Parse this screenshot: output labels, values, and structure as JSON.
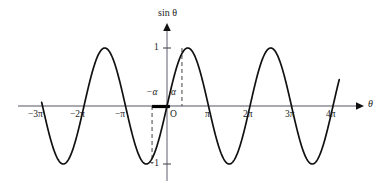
{
  "figure": {
    "kind": "sine-curve-graph",
    "background": "#ffffff",
    "curve_color": "#111111",
    "axis_color": "#8c8c99",
    "dash_color": "#555555",
    "highlight_color": "#000000"
  },
  "axes": {
    "y_axis_title": "sin θ",
    "x_axis_title": "θ",
    "origin_label": "O",
    "x_ticks": [
      {
        "label": "−3π",
        "value": -3
      },
      {
        "label": "−2π",
        "value": -2
      },
      {
        "label": "−π",
        "value": -1
      },
      {
        "label": "π",
        "value": 1
      },
      {
        "label": "2π",
        "value": 2
      },
      {
        "label": "3π",
        "value": 3
      },
      {
        "label": "4π",
        "value": 4
      }
    ],
    "y_ticks": [
      {
        "label": "1",
        "value": 1
      },
      {
        "label": "−1",
        "value": -1
      }
    ],
    "alpha_labels": [
      {
        "label": "−α",
        "value": -0.36
      },
      {
        "label": "α",
        "value": 0.36
      }
    ]
  },
  "chart_data": {
    "type": "line",
    "title": "",
    "subtitle": "",
    "xlabel": "θ",
    "ylabel": "sin θ",
    "function": "y = sin(theta)",
    "xlim": [
      -3.18,
      4.2
    ],
    "ylim": [
      -1.35,
      1.35
    ],
    "x_unit": "pi",
    "grid": false,
    "legend": null,
    "x_tick_values": [
      -3,
      -2,
      -1,
      1,
      2,
      3,
      4
    ],
    "x_tick_labels": [
      "−3π",
      "−2π",
      "−π",
      "π",
      "2π",
      "3π",
      "4π"
    ],
    "y_tick_values": [
      1,
      -1
    ],
    "y_tick_labels": [
      "1",
      "−1"
    ],
    "series": [
      {
        "name": "sin θ",
        "x_start_pi": -3.02,
        "x_end_pi": 4.15,
        "amplitude": 1,
        "period_pi": 2,
        "peaks_pi": [
          -2.5,
          -0.5,
          1.5,
          3.5
        ],
        "troughs_pi": [
          -1.5,
          0.5,
          2.5
        ],
        "zeros_pi": [
          -3,
          -2,
          -1,
          0,
          1,
          2,
          3,
          4
        ]
      }
    ],
    "annotations": [
      {
        "name": "alpha-marker",
        "label": "α",
        "x_pi": 0.36,
        "y": 0.95,
        "type": "dashed-vertical",
        "from_y": 0,
        "to_y": 1
      },
      {
        "name": "neg-alpha-marker",
        "label": "−α",
        "x_pi": -0.36,
        "y": -0.95,
        "type": "dashed-vertical",
        "from_y": 0,
        "to_y": -1
      },
      {
        "name": "interval-bar",
        "label": "",
        "x_from_pi": -0.36,
        "x_to_pi": 0.07,
        "type": "thick-segment-on-x-axis"
      }
    ]
  }
}
